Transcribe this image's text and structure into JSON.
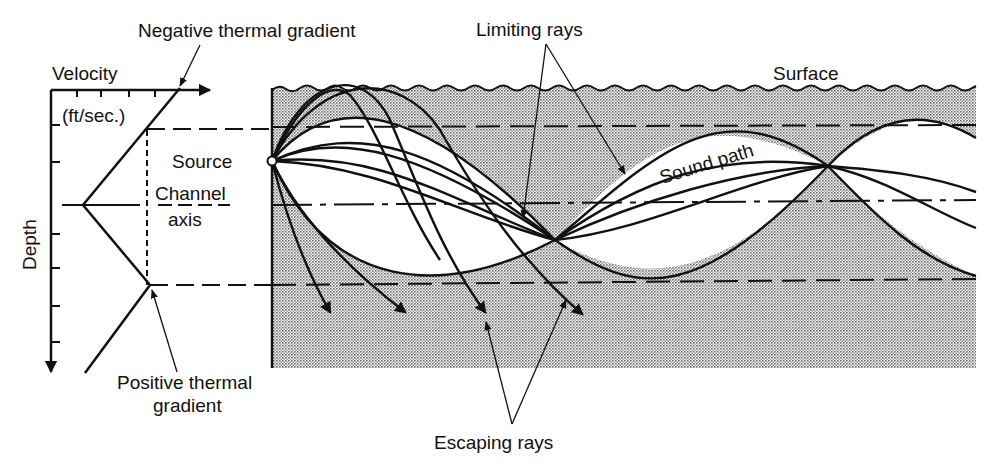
{
  "diagram": {
    "colors": {
      "ink": "#111111",
      "water_shade": "#c8c8c8",
      "channel_clear": "#ffffff",
      "background": "#ffffff"
    },
    "labels": {
      "negative_gradient": "Negative thermal gradient",
      "limiting_rays": "Limiting rays",
      "velocity": "Velocity",
      "velocity_unit": "(ft/sec.)",
      "surface": "Surface",
      "source": "Source",
      "channel": "Channel",
      "axis": "axis",
      "sound_path": "Sound path",
      "depth": "Depth",
      "positive_gradient_line1": "Positive thermal",
      "positive_gradient_line2": "gradient",
      "escaping_rays": "Escaping rays"
    },
    "velocity_profile": {
      "x_axis": "Velocity (ft/sec.)",
      "y_axis": "Depth",
      "minimum_velocity_depth": "Channel axis",
      "upper_segment": "Negative thermal gradient",
      "lower_segment": "Positive thermal gradient"
    },
    "layers": [
      {
        "name": "Surface",
        "y": 88
      },
      {
        "name": "Upper channel boundary",
        "y": 127
      },
      {
        "name": "Channel axis",
        "y": 205
      },
      {
        "name": "Lower channel boundary",
        "y": 285
      }
    ],
    "ray_groups": [
      {
        "name": "Trapped sound path rays",
        "count": 4
      },
      {
        "name": "Limiting rays",
        "count": 2
      },
      {
        "name": "Escaping rays",
        "count": 4
      }
    ]
  }
}
